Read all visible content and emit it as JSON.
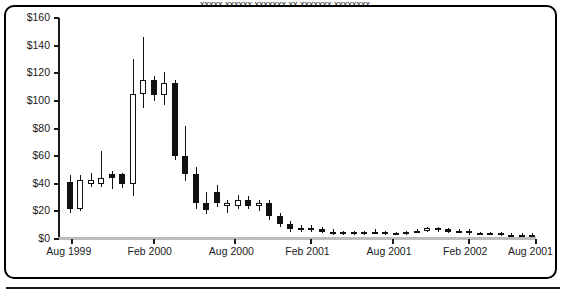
{
  "caption": {
    "clipped_top_text": "xxxxx xxxxxx xxxxxxx xx xxxxxxx xxxxxxxx"
  },
  "chart_data": {
    "type": "candlestick",
    "title": "",
    "xlabel": "",
    "ylabel": "",
    "ylim": [
      0,
      160
    ],
    "grid": false,
    "legend": null,
    "y_ticks": [
      "$0",
      "$20",
      "$40",
      "$60",
      "$80",
      "$100",
      "$120",
      "$140",
      "$160"
    ],
    "y_tick_values": [
      0,
      20,
      40,
      60,
      80,
      100,
      120,
      140,
      160
    ],
    "x_ticks": [
      "Aug 1999",
      "Feb 2000",
      "Aug 2000",
      "Feb 2001",
      "Aug 2001",
      "Feb 2002",
      "Aug 2001"
    ],
    "x_tick_positions": [
      0.03,
      0.2,
      0.37,
      0.53,
      0.7,
      0.86,
      1.0
    ],
    "candles": [
      {
        "x": 0.018,
        "open": 41,
        "high": 46,
        "low": 19,
        "close": 22,
        "dir": "down"
      },
      {
        "x": 0.04,
        "open": 22,
        "high": 46,
        "low": 20,
        "close": 43,
        "dir": "up"
      },
      {
        "x": 0.062,
        "open": 43,
        "high": 48,
        "low": 38,
        "close": 40,
        "dir": "up"
      },
      {
        "x": 0.084,
        "open": 40,
        "high": 64,
        "low": 38,
        "close": 44,
        "dir": "up"
      },
      {
        "x": 0.106,
        "open": 44,
        "high": 49,
        "low": 36,
        "close": 47,
        "dir": "down"
      },
      {
        "x": 0.128,
        "open": 47,
        "high": 48,
        "low": 37,
        "close": 40,
        "dir": "down"
      },
      {
        "x": 0.15,
        "open": 40,
        "high": 130,
        "low": 31,
        "close": 105,
        "dir": "up"
      },
      {
        "x": 0.172,
        "open": 105,
        "high": 146,
        "low": 95,
        "close": 115,
        "dir": "up"
      },
      {
        "x": 0.194,
        "open": 115,
        "high": 118,
        "low": 100,
        "close": 104,
        "dir": "down"
      },
      {
        "x": 0.216,
        "open": 104,
        "high": 121,
        "low": 97,
        "close": 113,
        "dir": "up"
      },
      {
        "x": 0.238,
        "open": 113,
        "high": 115,
        "low": 57,
        "close": 60,
        "dir": "down"
      },
      {
        "x": 0.26,
        "open": 60,
        "high": 82,
        "low": 42,
        "close": 47,
        "dir": "down"
      },
      {
        "x": 0.282,
        "open": 47,
        "high": 52,
        "low": 22,
        "close": 26,
        "dir": "down"
      },
      {
        "x": 0.304,
        "open": 26,
        "high": 34,
        "low": 18,
        "close": 21,
        "dir": "down"
      },
      {
        "x": 0.326,
        "open": 34,
        "high": 39,
        "low": 23,
        "close": 26,
        "dir": "down"
      },
      {
        "x": 0.348,
        "open": 26,
        "high": 28,
        "low": 19,
        "close": 24,
        "dir": "up"
      },
      {
        "x": 0.37,
        "open": 24,
        "high": 32,
        "low": 22,
        "close": 28,
        "dir": "up"
      },
      {
        "x": 0.392,
        "open": 28,
        "high": 31,
        "low": 22,
        "close": 24,
        "dir": "down"
      },
      {
        "x": 0.414,
        "open": 24,
        "high": 28,
        "low": 20,
        "close": 26,
        "dir": "up"
      },
      {
        "x": 0.436,
        "open": 26,
        "high": 28,
        "low": 14,
        "close": 17,
        "dir": "down"
      },
      {
        "x": 0.458,
        "open": 17,
        "high": 19,
        "low": 9,
        "close": 11,
        "dir": "down"
      },
      {
        "x": 0.48,
        "open": 11,
        "high": 13,
        "low": 5,
        "close": 7,
        "dir": "down"
      },
      {
        "x": 0.502,
        "open": 7,
        "high": 10,
        "low": 5,
        "close": 8,
        "dir": "up"
      },
      {
        "x": 0.524,
        "open": 8,
        "high": 10,
        "low": 5,
        "close": 7,
        "dir": "up"
      },
      {
        "x": 0.546,
        "open": 7,
        "high": 9,
        "low": 4,
        "close": 5,
        "dir": "down"
      },
      {
        "x": 0.568,
        "open": 5,
        "high": 7,
        "low": 3,
        "close": 4,
        "dir": "down"
      },
      {
        "x": 0.59,
        "open": 4,
        "high": 6,
        "low": 3,
        "close": 5,
        "dir": "down"
      },
      {
        "x": 0.612,
        "open": 5,
        "high": 6,
        "low": 3,
        "close": 4,
        "dir": "down"
      },
      {
        "x": 0.634,
        "open": 4,
        "high": 6,
        "low": 3,
        "close": 5,
        "dir": "down"
      },
      {
        "x": 0.656,
        "open": 5,
        "high": 7,
        "low": 4,
        "close": 5,
        "dir": "down"
      },
      {
        "x": 0.678,
        "open": 5,
        "high": 6,
        "low": 3,
        "close": 4,
        "dir": "down"
      },
      {
        "x": 0.7,
        "open": 4,
        "high": 5,
        "low": 3,
        "close": 4,
        "dir": "down"
      },
      {
        "x": 0.722,
        "open": 4,
        "high": 6,
        "low": 3,
        "close": 5,
        "dir": "down"
      },
      {
        "x": 0.744,
        "open": 5,
        "high": 7,
        "low": 4,
        "close": 6,
        "dir": "up"
      },
      {
        "x": 0.766,
        "open": 6,
        "high": 9,
        "low": 5,
        "close": 8,
        "dir": "up"
      },
      {
        "x": 0.788,
        "open": 8,
        "high": 9,
        "low": 5,
        "close": 7,
        "dir": "up"
      },
      {
        "x": 0.81,
        "open": 7,
        "high": 8,
        "low": 4,
        "close": 5,
        "dir": "down"
      },
      {
        "x": 0.832,
        "open": 5,
        "high": 7,
        "low": 4,
        "close": 6,
        "dir": "down"
      },
      {
        "x": 0.854,
        "open": 6,
        "high": 7,
        "low": 3,
        "close": 4,
        "dir": "down"
      },
      {
        "x": 0.876,
        "open": 4,
        "high": 5,
        "low": 3,
        "close": 4,
        "dir": "down"
      },
      {
        "x": 0.898,
        "open": 4,
        "high": 5,
        "low": 3,
        "close": 4,
        "dir": "down"
      },
      {
        "x": 0.92,
        "open": 4,
        "high": 5,
        "low": 2,
        "close": 3,
        "dir": "down"
      },
      {
        "x": 0.942,
        "open": 3,
        "high": 4,
        "low": 2,
        "close": 3,
        "dir": "down"
      },
      {
        "x": 0.964,
        "open": 3,
        "high": 4,
        "low": 2,
        "close": 3,
        "dir": "down"
      },
      {
        "x": 0.986,
        "open": 3,
        "high": 4,
        "low": 2,
        "close": 3,
        "dir": "down"
      }
    ]
  }
}
